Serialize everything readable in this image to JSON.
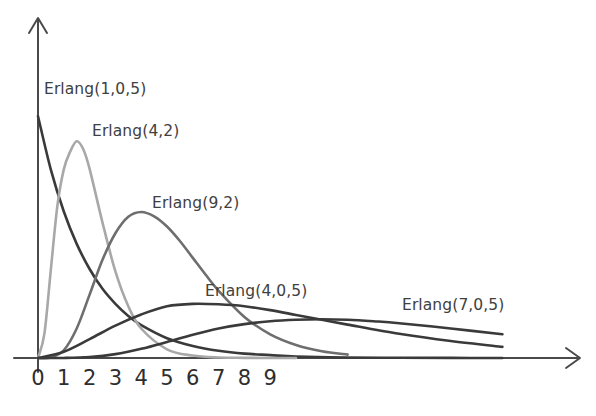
{
  "figure": {
    "background_color": "#ffffff",
    "axis_color": "#4a4a4a",
    "text_color": "#2e2e2e"
  },
  "axes": {
    "x_tick_labels": [
      "0",
      "1",
      "2",
      "3",
      "4",
      "5",
      "6",
      "7",
      "8",
      "9"
    ],
    "y_tick_labels": [],
    "x_axis_arrow": "arrow-right-icon",
    "y_axis_arrow": "arrow-up-icon"
  },
  "curve_labels": [
    {
      "text": "Erlang(1,0,5)",
      "x": 44,
      "y": 82
    },
    {
      "text": "Erlang(4,2)",
      "x": 92,
      "y": 124
    },
    {
      "text": "Erlang(9,2)",
      "x": 152,
      "y": 196
    },
    {
      "text": "Erlang(4,0,5)",
      "x": 205,
      "y": 284
    },
    {
      "text": "Erlang(7,0,5)",
      "x": 402,
      "y": 298
    }
  ],
  "chart_data": {
    "type": "line",
    "title": "",
    "subtitle": "",
    "xlabel": "",
    "ylabel": "",
    "grid": false,
    "legend": "inline-annotations",
    "xlim": [
      0,
      21
    ],
    "ylim": [
      0,
      0.55
    ],
    "x_tick_values": [
      0,
      1,
      2,
      3,
      4,
      5,
      6,
      7,
      8,
      9
    ],
    "series": [
      {
        "name": "Erlang(1,0,5)",
        "shape_k": 1,
        "rate_lambda": 0.5,
        "color": "#3a3a3a",
        "peak_x": 0,
        "peak_y": 0.5,
        "x": [
          0,
          0.5,
          1,
          1.5,
          2,
          2.5,
          3,
          3.5,
          4,
          5,
          6,
          7,
          8,
          9,
          10,
          12,
          14,
          16,
          18,
          21
        ],
        "y": [
          0.5,
          0.389,
          0.303,
          0.236,
          0.184,
          0.143,
          0.112,
          0.087,
          0.068,
          0.041,
          0.025,
          0.015,
          0.009,
          0.006,
          0.003,
          0.001,
          0.0005,
          0.0002,
          0.0001,
          0.0
        ]
      },
      {
        "name": "Erlang(4,2)",
        "shape_k": 4,
        "rate_lambda": 2,
        "color": "#a8a8a8",
        "peak_x": 1.5,
        "peak_y": 0.448,
        "x": [
          0,
          0.25,
          0.5,
          0.75,
          1,
          1.25,
          1.5,
          1.75,
          2,
          2.5,
          3,
          3.5,
          4,
          5,
          6,
          7,
          8,
          9,
          10
        ],
        "y": [
          0.0,
          0.051,
          0.184,
          0.314,
          0.39,
          0.427,
          0.448,
          0.432,
          0.391,
          0.28,
          0.179,
          0.107,
          0.061,
          0.018,
          0.005,
          0.001,
          0.0003,
          0.0001,
          0.0
        ]
      },
      {
        "name": "Erlang(9,2)",
        "shape_k": 9,
        "rate_lambda": 2,
        "color": "#6e6e6e",
        "peak_x": 4,
        "peak_y": 0.302,
        "x": [
          0,
          0.5,
          1,
          1.5,
          2,
          2.5,
          3,
          3.5,
          4,
          4.5,
          5,
          5.5,
          6,
          6.5,
          7,
          8,
          9,
          10,
          11,
          12
        ],
        "y": [
          0.0,
          0.001,
          0.016,
          0.061,
          0.131,
          0.203,
          0.258,
          0.292,
          0.302,
          0.293,
          0.272,
          0.242,
          0.207,
          0.172,
          0.139,
          0.085,
          0.049,
          0.027,
          0.014,
          0.007
        ]
      },
      {
        "name": "Erlang(4,0,5)",
        "shape_k": 4,
        "rate_lambda": 0.5,
        "color": "#3a3a3a",
        "peak_x": 6,
        "peak_y": 0.112,
        "x": [
          0,
          1,
          2,
          3,
          4,
          5,
          6,
          7,
          8,
          9,
          10,
          11,
          12,
          14,
          16,
          18,
          21
        ],
        "y": [
          0.0,
          0.013,
          0.039,
          0.067,
          0.09,
          0.107,
          0.112,
          0.111,
          0.107,
          0.099,
          0.089,
          0.079,
          0.069,
          0.05,
          0.035,
          0.023,
          0.012
        ]
      },
      {
        "name": "Erlang(7,0,5)",
        "shape_k": 7,
        "rate_lambda": 0.5,
        "color": "#3a3a3a",
        "peak_x": 12,
        "peak_y": 0.079,
        "x": [
          0,
          1,
          2,
          3,
          4,
          5,
          6,
          7,
          8,
          9,
          10,
          11,
          12,
          13,
          14,
          16,
          18,
          21
        ],
        "y": [
          0.0,
          0.0001,
          0.002,
          0.008,
          0.019,
          0.033,
          0.048,
          0.061,
          0.07,
          0.076,
          0.079,
          0.08,
          0.079,
          0.076,
          0.072,
          0.061,
          0.049,
          0.033
        ]
      }
    ]
  }
}
